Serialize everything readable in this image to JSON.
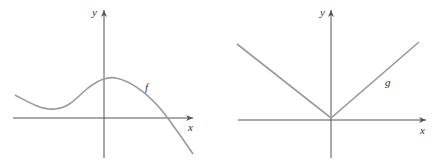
{
  "graphs": [
    {
      "id": "left",
      "function_label": "f",
      "x_axis_label": "x",
      "y_axis_label": "y",
      "description": "Smooth curve: decreases to a local minimum left of the y-axis, rises to a local maximum just right of the y-axis, then decreases crossing the x-axis and continuing downward"
    },
    {
      "id": "right",
      "function_label": "g",
      "x_axis_label": "x",
      "y_axis_label": "y",
      "description": "V-shaped graph (absolute value) with vertex at the origin"
    }
  ]
}
